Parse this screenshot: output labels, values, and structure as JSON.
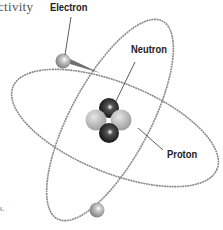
{
  "diagram": {
    "labels": {
      "electron": "Electron",
      "neutron": "Neutron",
      "proton": "Proton"
    },
    "text_fragments": {
      "top_left": "ctivity",
      "bottom_left": "s."
    },
    "components": {
      "electrons": 2,
      "orbits": 2,
      "nucleus": {
        "neutrons": 2,
        "protons": 2
      }
    },
    "colors": {
      "neutron": "#1a1a1a",
      "proton": "#bdbdbd",
      "electron": "#a8a8a8",
      "orbit": "#8a8a8a",
      "label_text": "#222222"
    }
  }
}
